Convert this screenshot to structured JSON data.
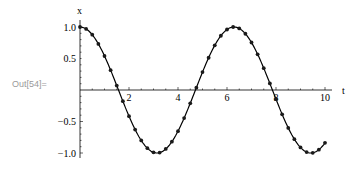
{
  "cell": {
    "out_label": "Out[54]="
  },
  "chart_data": {
    "type": "line",
    "title": "",
    "xlabel": "t",
    "ylabel": "x",
    "xlim": [
      0,
      10
    ],
    "ylim": [
      -1.0,
      1.0
    ],
    "grid": false,
    "legend": null,
    "x_ticks": [
      2,
      4,
      6,
      8,
      10
    ],
    "y_ticks": [
      1.0,
      0.5,
      -0.5,
      -1.0
    ],
    "x_tick_labels": [
      "2",
      "4",
      "6",
      "8",
      "10"
    ],
    "y_tick_labels": [
      "1.0",
      "0.5",
      "-0.5",
      "-1.0"
    ],
    "series": [
      {
        "name": "x(t) = cos(t)",
        "markers": true,
        "x": [
          0,
          0.25,
          0.5,
          0.75,
          1,
          1.25,
          1.5,
          1.75,
          2,
          2.25,
          2.5,
          2.75,
          3,
          3.25,
          3.5,
          3.75,
          4,
          4.25,
          4.5,
          4.75,
          5,
          5.25,
          5.5,
          5.75,
          6,
          6.25,
          6.5,
          6.75,
          7,
          7.25,
          7.5,
          7.75,
          8,
          8.25,
          8.5,
          8.75,
          9,
          9.25,
          9.5,
          9.75,
          10
        ],
        "values": [
          1.0,
          0.969,
          0.878,
          0.732,
          0.54,
          0.315,
          0.071,
          -0.178,
          -0.416,
          -0.628,
          -0.801,
          -0.924,
          -0.99,
          -0.994,
          -0.936,
          -0.82,
          -0.654,
          -0.446,
          -0.211,
          0.037,
          0.284,
          0.512,
          0.709,
          0.861,
          0.96,
          1.0,
          0.977,
          0.893,
          0.754,
          0.566,
          0.347,
          0.104,
          -0.146,
          -0.386,
          -0.602,
          -0.781,
          -0.911,
          -0.985,
          -0.997,
          -0.948,
          -0.839
        ]
      }
    ]
  },
  "colors": {
    "line": "#000000",
    "marker": "#1a1a1a",
    "axis": "#000000"
  }
}
